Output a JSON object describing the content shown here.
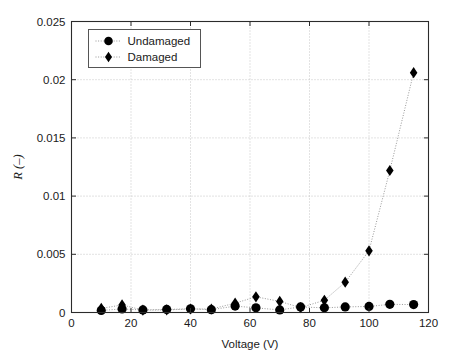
{
  "chart_data": {
    "type": "scatter",
    "title": "",
    "xlabel": "Voltage (V)",
    "ylabel": "R (–)",
    "xlim": [
      0,
      120
    ],
    "ylim": [
      0,
      0.025
    ],
    "xticks": [
      0,
      20,
      40,
      60,
      80,
      100,
      120
    ],
    "xtick_labels": [
      "0",
      "20",
      "40",
      "60",
      "80",
      "100",
      "120"
    ],
    "yticks": [
      0,
      0.005,
      0.01,
      0.015,
      0.02,
      0.025
    ],
    "ytick_labels": [
      "0",
      "0.005",
      "0.01",
      "0.015",
      "0.02",
      "0.025"
    ],
    "grid": true,
    "grid_style": "dotted",
    "legend_position": "upper left",
    "marker_color": "#000000",
    "line_color": "#8c8c8c",
    "series": [
      {
        "name": "Undamaged",
        "marker": "circle",
        "linestyle": "dotted",
        "x": [
          10,
          17,
          24,
          32,
          40,
          47,
          55,
          62,
          70,
          77,
          85,
          92,
          100,
          107,
          115
        ],
        "y": [
          0.00018,
          0.0003,
          0.00022,
          0.00026,
          0.00032,
          0.00024,
          0.00055,
          0.0004,
          0.00022,
          0.00048,
          0.0004,
          0.00048,
          0.00052,
          0.0007,
          0.00068
        ]
      },
      {
        "name": "Damaged",
        "marker": "diamond",
        "linestyle": "dotted",
        "x": [
          10,
          17,
          24,
          32,
          40,
          47,
          55,
          62,
          70,
          77,
          85,
          92,
          100,
          107,
          115
        ],
        "y": [
          0.00035,
          0.00065,
          0.0002,
          0.00022,
          0.0003,
          0.0003,
          0.0008,
          0.00135,
          0.00095,
          0.00042,
          0.00105,
          0.0026,
          0.0053,
          0.0122,
          0.0206
        ]
      }
    ],
    "legend": [
      {
        "label": "Undamaged",
        "marker": "circle"
      },
      {
        "label": "Damaged",
        "marker": "diamond"
      }
    ]
  }
}
